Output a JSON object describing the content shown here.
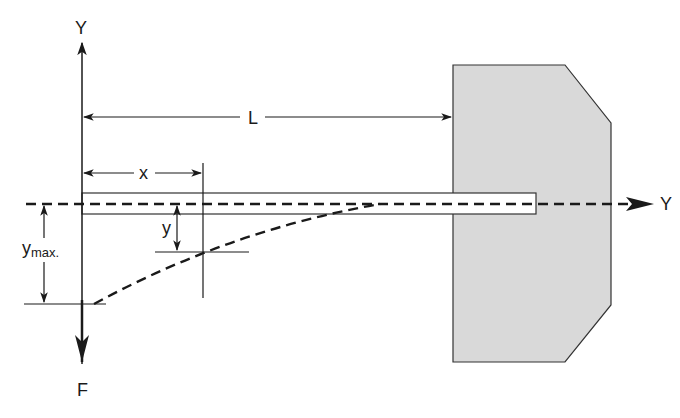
{
  "diagram": {
    "labels": {
      "y_axis_top": "Y",
      "y_axis_right": "Y",
      "length": "L",
      "position": "x",
      "deflection": "y",
      "max_deflection_base": "y",
      "max_deflection_sub": "max.",
      "force": "F"
    },
    "colors": {
      "stroke": "#1a1a1a",
      "wall_fill": "#d9d9d9",
      "wall_stroke": "#333333",
      "beam_fill": "#ffffff",
      "background": "#ffffff"
    }
  }
}
